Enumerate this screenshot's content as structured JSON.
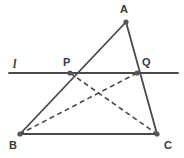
{
  "figure": {
    "canvas": {
      "width": 184,
      "height": 158,
      "background": "#ffffff"
    },
    "style": {
      "stroke_color": "#4a4a4a",
      "point_color": "#555555",
      "label_color": "#3a3a3a",
      "solid_width": 1.8,
      "dashed_width": 1.6,
      "dash_pattern": "5,3.5",
      "point_radius": 2.6
    },
    "points": [
      {
        "id": "A",
        "label": "A",
        "x": 126,
        "y": 22,
        "label_x": 120,
        "label_y": 4,
        "kind": "vertex"
      },
      {
        "id": "B",
        "label": "B",
        "x": 20,
        "y": 134,
        "label_x": 9,
        "label_y": 140,
        "kind": "vertex"
      },
      {
        "id": "C",
        "label": "C",
        "x": 157,
        "y": 134,
        "label_x": 164,
        "label_y": 140,
        "kind": "vertex"
      },
      {
        "id": "P",
        "label": "P",
        "x": 70,
        "y": 73,
        "label_x": 63,
        "label_y": 57,
        "kind": "intersection"
      },
      {
        "id": "Q",
        "label": "Q",
        "x": 137,
        "y": 73,
        "label_x": 142,
        "label_y": 57,
        "kind": "intersection"
      }
    ],
    "line_label": {
      "text": "l",
      "x": 13,
      "y": 58
    },
    "transversal": {
      "id": "l",
      "x1": 9,
      "y1": 73,
      "x2": 178,
      "y2": 73,
      "style": "solid"
    },
    "segments": [
      {
        "id": "AB",
        "from": "A",
        "to": "B",
        "style": "solid"
      },
      {
        "id": "AC",
        "from": "A",
        "to": "C",
        "style": "solid"
      },
      {
        "id": "BC",
        "from": "B",
        "to": "C",
        "style": "solid"
      },
      {
        "id": "PC",
        "from": "P",
        "to": "C",
        "style": "dashed"
      },
      {
        "id": "QB",
        "from": "Q",
        "to": "B",
        "style": "dashed"
      }
    ]
  }
}
